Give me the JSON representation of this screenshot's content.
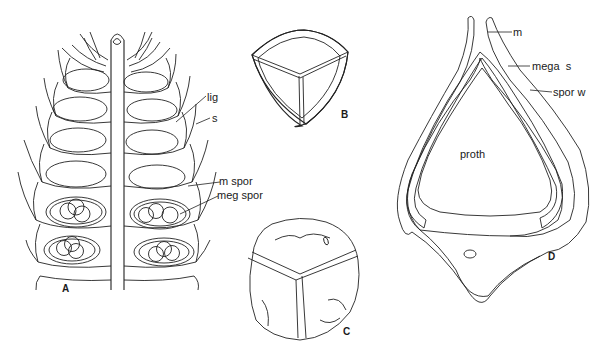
{
  "figure": {
    "panels": [
      {
        "id": "A",
        "label": "A",
        "subject": "strobilus longitudinal section"
      },
      {
        "id": "B",
        "label": "B",
        "subject": "spore with triradiate ridge"
      },
      {
        "id": "C",
        "label": "C",
        "subject": "megaspore surface"
      },
      {
        "id": "D",
        "label": "D",
        "subject": "megaspore section with prothallus"
      }
    ],
    "labels": {
      "lig": "lig",
      "s": "s",
      "m_spor": "m spor",
      "meg_spor": "meg spor",
      "m": "m",
      "mega_s": "mega  s",
      "spor_w": "spor w",
      "proth": "proth"
    },
    "colors": {
      "ink": "#222222",
      "background": "#ffffff",
      "stipple": "#888888"
    }
  }
}
